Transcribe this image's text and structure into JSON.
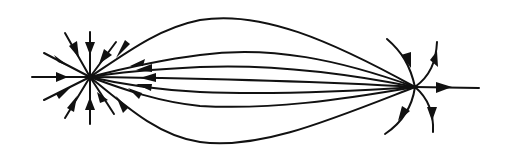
{
  "diagram": {
    "title": "",
    "colors": {
      "background": "#ffffff",
      "stroke": "#111111"
    },
    "left_node": {
      "role": "sink",
      "x": 90,
      "y": 77,
      "radial_spokes": 12
    },
    "right_node": {
      "role": "source",
      "x": 415,
      "y": 87
    },
    "connecting_lines": 8,
    "diverging_lines_at_right": 5,
    "labels": []
  }
}
